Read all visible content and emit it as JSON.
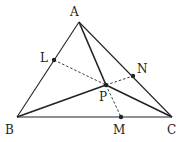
{
  "diagram": {
    "points": {
      "A": {
        "label": "A",
        "x": 79,
        "y": 22,
        "lx": 70,
        "ly": 16
      },
      "B": {
        "label": "B",
        "x": 17,
        "y": 117,
        "lx": 5,
        "ly": 134
      },
      "C": {
        "label": "C",
        "x": 172,
        "y": 117,
        "lx": 167,
        "ly": 134
      },
      "L": {
        "label": "L",
        "x": 54,
        "y": 60,
        "lx": 40,
        "ly": 60
      },
      "N": {
        "label": "N",
        "x": 133,
        "y": 76,
        "lx": 137,
        "ly": 73
      },
      "P": {
        "label": "P",
        "x": 106,
        "y": 85,
        "lx": 99,
        "ly": 101
      },
      "M": {
        "label": "M",
        "x": 121,
        "y": 117,
        "lx": 113,
        "ly": 134
      }
    },
    "solid_segments": [
      "AB",
      "BC",
      "CA",
      "AP",
      "BP",
      "CP"
    ],
    "dashed_segments": [
      "LP",
      "PN",
      "PM"
    ],
    "line_color": "#222222"
  }
}
